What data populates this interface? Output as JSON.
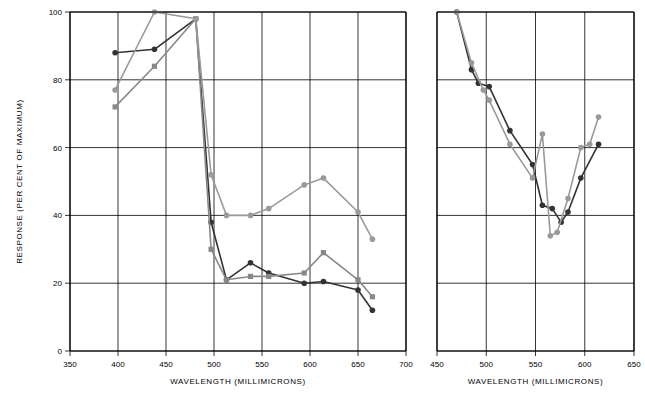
{
  "chart_data": [
    {
      "id": "left-panel",
      "type": "line",
      "title": "",
      "xlabel": "WAVELENGTH (MILLIMICRONS)",
      "ylabel": "RESPONSE (PER CENT OF MAXIMUM)",
      "xlim": [
        350,
        700
      ],
      "ylim": [
        0,
        100
      ],
      "xticks": [
        350,
        400,
        450,
        500,
        550,
        600,
        650,
        700
      ],
      "yticks": [
        0,
        20,
        40,
        60,
        80,
        100
      ],
      "grid": true,
      "series": [
        {
          "name": "dark-curve",
          "color": "#333333",
          "marker": "circle",
          "points": [
            [
              397,
              88
            ],
            [
              438,
              89
            ],
            [
              481,
              98
            ],
            [
              497,
              38
            ],
            [
              513,
              21
            ],
            [
              538,
              26
            ],
            [
              557,
              23
            ],
            [
              594,
              20
            ],
            [
              614,
              20.5
            ],
            [
              650,
              18
            ],
            [
              665,
              12
            ]
          ]
        },
        {
          "name": "mid-gray-curve",
          "color": "#888888",
          "marker": "square",
          "points": [
            [
              397,
              72
            ],
            [
              438,
              84
            ],
            [
              481,
              98
            ],
            [
              497,
              30
            ],
            [
              513,
              21
            ],
            [
              538,
              22
            ],
            [
              557,
              22
            ],
            [
              594,
              23
            ],
            [
              614,
              29
            ],
            [
              650,
              21
            ],
            [
              665,
              16
            ]
          ]
        },
        {
          "name": "light-gray-curve",
          "color": "#9a9a9a",
          "marker": "circle",
          "points": [
            [
              397,
              77
            ],
            [
              438,
              100
            ],
            [
              481,
              98
            ],
            [
              497,
              52
            ],
            [
              513,
              40
            ],
            [
              538,
              40
            ],
            [
              557,
              42
            ],
            [
              594,
              49
            ],
            [
              614,
              51
            ],
            [
              650,
              41
            ],
            [
              665,
              33
            ]
          ]
        }
      ]
    },
    {
      "id": "right-panel",
      "type": "line",
      "title": "",
      "xlabel": "WAVELENGTH (MILLIMICRONS)",
      "ylabel": "",
      "xlim": [
        450,
        650
      ],
      "ylim": [
        0,
        100
      ],
      "xticks": [
        450,
        500,
        550,
        600,
        650
      ],
      "yticks": [
        0,
        20,
        40,
        60,
        80,
        100
      ],
      "grid": true,
      "series": [
        {
          "name": "dark-curve",
          "color": "#333333",
          "marker": "circle",
          "points": [
            [
              470,
              100
            ],
            [
              485,
              83
            ],
            [
              492,
              79
            ],
            [
              503,
              78
            ],
            [
              524,
              65
            ],
            [
              547,
              55
            ],
            [
              557,
              43
            ],
            [
              567,
              42
            ],
            [
              576,
              38
            ],
            [
              583,
              41
            ],
            [
              596,
              51
            ],
            [
              614,
              61
            ]
          ]
        },
        {
          "name": "light-gray-curve",
          "color": "#9a9a9a",
          "marker": "circle",
          "points": [
            [
              470,
              100
            ],
            [
              485,
              85
            ],
            [
              497,
              77
            ],
            [
              503,
              74
            ],
            [
              524,
              61
            ],
            [
              547,
              51
            ],
            [
              557,
              64
            ],
            [
              565,
              34
            ],
            [
              572,
              35
            ],
            [
              583,
              45
            ],
            [
              596,
              60
            ],
            [
              605,
              61
            ],
            [
              614,
              69
            ]
          ]
        }
      ]
    }
  ],
  "labels": {
    "y_axis_title": "RESPONSE (PER CENT OF MAXIMUM)",
    "x_axis_title_left": "WAVELENGTH (MILLIMICRONS)",
    "x_axis_title_right": "WAVELENGTH (MILLIMICRONS)",
    "left_yticks": [
      "0",
      "20",
      "40",
      "60",
      "80",
      "100"
    ],
    "left_xticks": [
      "350",
      "400",
      "450",
      "500",
      "550",
      "600",
      "650",
      "700"
    ],
    "right_xticks": [
      "450",
      "500",
      "550",
      "600",
      "650"
    ]
  },
  "colors": {
    "dark": "#333333",
    "mid": "#888888",
    "light": "#9a9a9a",
    "axis": "#000000",
    "grid": "#000000",
    "background": "#ffffff"
  }
}
